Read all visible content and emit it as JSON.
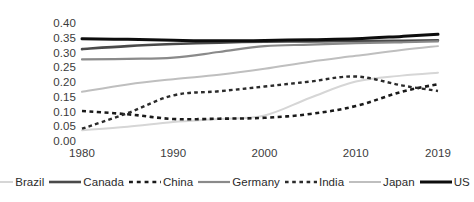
{
  "chart_data": {
    "type": "line",
    "title": "",
    "subtitle": "",
    "xlabel": "",
    "ylabel": "",
    "x": [
      1980,
      1985,
      1990,
      1995,
      2000,
      2005,
      2010,
      2015,
      2019
    ],
    "x_tick_labels": [
      "1980",
      "1990",
      "2000",
      "2010",
      "2019"
    ],
    "x_tick_values": [
      1980,
      1990,
      2000,
      2010,
      2019
    ],
    "y_tick_labels": [
      "0.00",
      "0.05",
      "0.10",
      "0.15",
      "0.20",
      "0.25",
      "0.30",
      "0.35",
      "0.40"
    ],
    "y_tick_values": [
      0.0,
      0.05,
      0.1,
      0.15,
      0.2,
      0.25,
      0.3,
      0.35,
      0.4
    ],
    "ylim": [
      0.0,
      0.4
    ],
    "xlim": [
      1980,
      2019
    ],
    "grid": false,
    "legend_position": "bottom",
    "series": [
      {
        "name": "Brazil",
        "color": "#d6d6d6",
        "style": "solid",
        "width": 2.0,
        "values": [
          0.04,
          0.052,
          0.068,
          0.078,
          0.09,
          0.15,
          0.205,
          0.225,
          0.235
        ]
      },
      {
        "name": "Canada",
        "color": "#4a4a4a",
        "style": "solid",
        "width": 2.6,
        "values": [
          0.315,
          0.325,
          0.332,
          0.337,
          0.34,
          0.341,
          0.342,
          0.343,
          0.345
        ]
      },
      {
        "name": "China",
        "color": "#1a1a1a",
        "style": "dashed",
        "width": 2.6,
        "values": [
          0.105,
          0.094,
          0.078,
          0.079,
          0.082,
          0.095,
          0.122,
          0.17,
          0.196
        ]
      },
      {
        "name": "Germany",
        "color": "#8a8a8a",
        "style": "solid",
        "width": 2.2,
        "values": [
          0.28,
          0.282,
          0.286,
          0.305,
          0.325,
          0.33,
          0.335,
          0.338,
          0.341
        ]
      },
      {
        "name": "India",
        "color": "#2b2b2b",
        "style": "dashed",
        "width": 2.4,
        "values": [
          0.045,
          0.098,
          0.158,
          0.172,
          0.188,
          0.205,
          0.222,
          0.192,
          0.173
        ]
      },
      {
        "name": "Japan",
        "color": "#bfbfbf",
        "style": "solid",
        "width": 2.0,
        "values": [
          0.17,
          0.195,
          0.213,
          0.228,
          0.248,
          0.272,
          0.292,
          0.312,
          0.325
        ]
      },
      {
        "name": "US",
        "color": "#0d0d0d",
        "style": "solid",
        "width": 3.0,
        "values": [
          0.35,
          0.348,
          0.345,
          0.343,
          0.344,
          0.347,
          0.35,
          0.358,
          0.365
        ]
      }
    ]
  },
  "legend": {
    "items": [
      {
        "label": "Brazil"
      },
      {
        "label": "Canada"
      },
      {
        "label": "China"
      },
      {
        "label": "Germany"
      },
      {
        "label": "India"
      },
      {
        "label": "Japan"
      },
      {
        "label": "US"
      }
    ]
  }
}
